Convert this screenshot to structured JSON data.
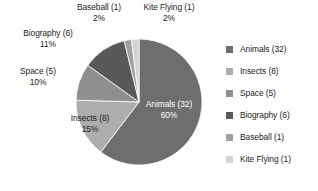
{
  "chart_data": {
    "type": "pie",
    "title": "",
    "legend_position": "right",
    "grid": false,
    "total": 53,
    "categories": [
      "Animals",
      "Insects",
      "Space",
      "Biography",
      "Baseball",
      "Kite Flying"
    ],
    "values": [
      32,
      8,
      5,
      6,
      1,
      1
    ],
    "percents": [
      60,
      15,
      10,
      11,
      2,
      2
    ],
    "colors": [
      "#6e6e6e",
      "#adadad",
      "#8f8f8f",
      "#595959",
      "#a0a0a0",
      "#d4d4d4"
    ],
    "slices": [
      {
        "name": "Animals",
        "value": 32,
        "percent": 60,
        "color": "#6e6e6e",
        "start_angle": 0,
        "end_angle": 217.4,
        "label_name": "Animals (32)",
        "label_pct": "60%",
        "label_placement": "inside",
        "label_color": "#ffffff"
      },
      {
        "name": "Insects",
        "value": 8,
        "percent": 15,
        "color": "#adadad",
        "start_angle": 217.4,
        "end_angle": 271.7,
        "label_name": "Insects (8)",
        "label_pct": "15%",
        "label_placement": "inside",
        "label_color": "#1b1b1b"
      },
      {
        "name": "Space",
        "value": 5,
        "percent": 10,
        "color": "#8f8f8f",
        "start_angle": 271.7,
        "end_angle": 305.7,
        "label_name": "Space (5)",
        "label_pct": "10%",
        "label_placement": "outside",
        "label_color": "#1b1b1b"
      },
      {
        "name": "Biography",
        "value": 6,
        "percent": 11,
        "color": "#595959",
        "start_angle": 305.7,
        "end_angle": 346.4,
        "label_name": "Biography (6)",
        "label_pct": "11%",
        "label_placement": "outside",
        "label_color": "#1b1b1b"
      },
      {
        "name": "Baseball",
        "value": 1,
        "percent": 2,
        "color": "#a0a0a0",
        "start_angle": 346.4,
        "end_angle": 353.2,
        "label_name": "Baseball (1)",
        "label_pct": "2%",
        "label_placement": "outside",
        "label_color": "#1b1b1b"
      },
      {
        "name": "Kite Flying",
        "value": 1,
        "percent": 2,
        "color": "#d4d4d4",
        "start_angle": 353.2,
        "end_angle": 360,
        "label_name": "Kite Flying (1)",
        "label_pct": "2%",
        "label_placement": "outside",
        "label_color": "#1b1b1b"
      }
    ]
  },
  "legend": {
    "items": [
      {
        "label": "Animals (32)",
        "color": "#6e6e6e"
      },
      {
        "label": "Insects (8)",
        "color": "#adadad"
      },
      {
        "label": "Space (5)",
        "color": "#8f8f8f"
      },
      {
        "label": "Biography (6)",
        "color": "#595959"
      },
      {
        "label": "Baseball (1)",
        "color": "#a0a0a0"
      },
      {
        "label": "Kite Flying (1)",
        "color": "#d4d4d4"
      }
    ]
  },
  "geometry": {
    "center_x": 139,
    "center_y": 102,
    "radius": 63
  }
}
